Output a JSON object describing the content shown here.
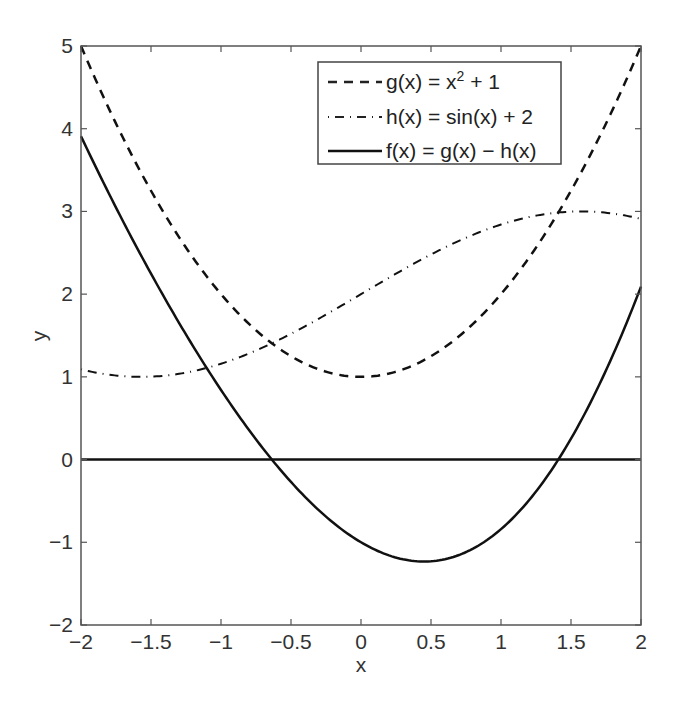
{
  "chart_data": {
    "type": "line",
    "title": "",
    "xlabel": "x",
    "ylabel": "y",
    "xlim": [
      -2,
      2
    ],
    "ylim": [
      -2,
      5
    ],
    "x_ticks": [
      "−2",
      "−1.5",
      "−1",
      "−0.5",
      "0",
      "0.5",
      "1",
      "1.5",
      "2"
    ],
    "y_ticks": [
      "−2",
      "−1",
      "0",
      "1",
      "2",
      "3",
      "4",
      "5"
    ],
    "grid": false,
    "legend_position": "upper-center-right",
    "series": [
      {
        "name": "g(x) = x² + 1",
        "style": "dashed",
        "formula": "x^2 + 1",
        "x": [
          -2,
          -1.5,
          -1,
          -0.5,
          0,
          0.5,
          1,
          1.5,
          2
        ],
        "values": [
          5,
          3.25,
          2,
          1.25,
          1,
          1.25,
          2,
          3.25,
          5
        ]
      },
      {
        "name": "h(x) = sin(x) + 2",
        "style": "dash-dot",
        "formula": "sin(x) + 2",
        "x": [
          -2,
          -1.5,
          -1,
          -0.5,
          0,
          0.5,
          1,
          1.5,
          2
        ],
        "values": [
          1.09,
          1.0,
          1.16,
          1.52,
          2,
          2.48,
          2.84,
          3.0,
          2.91
        ]
      },
      {
        "name": "f(x) = g(x) − h(x)",
        "style": "solid",
        "formula": "x^2 - sin(x) - 1",
        "x": [
          -2,
          -1.5,
          -1,
          -0.5,
          0,
          0.5,
          1,
          1.5,
          2
        ],
        "values": [
          3.91,
          2.25,
          0.84,
          -0.27,
          -1,
          -1.23,
          -0.84,
          0.25,
          2.09
        ]
      },
      {
        "name": "y = 0",
        "style": "solid",
        "formula": "0",
        "x": [
          -2,
          2
        ],
        "values": [
          0,
          0
        ]
      }
    ]
  },
  "legend": {
    "entries": [
      {
        "prefix": "g(x) = x",
        "sup": "2",
        "suffix": " + 1"
      },
      {
        "prefix": "h(x) = sin(x) + 2",
        "sup": "",
        "suffix": ""
      },
      {
        "prefix": "f(x) = g(x) − h(x)",
        "sup": "",
        "suffix": ""
      }
    ]
  }
}
